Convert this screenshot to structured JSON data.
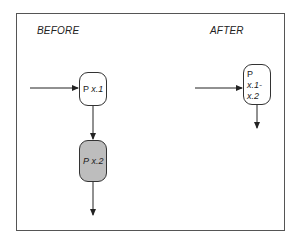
{
  "diagram": {
    "before": {
      "heading": "BEFORE",
      "nodes": [
        {
          "prefix": "P",
          "suffix": "x.1",
          "shaded": false
        },
        {
          "prefix": "P",
          "suffix": "x.2",
          "shaded": true
        }
      ]
    },
    "after": {
      "heading": "AFTER",
      "nodes": [
        {
          "prefix": "P",
          "suffix_line1": "x.1-",
          "suffix_line2": "x.2",
          "shaded": false
        }
      ]
    },
    "colors": {
      "stroke": "#333333",
      "shaded_fill": "#bdbdbd",
      "background": "#ffffff"
    }
  }
}
